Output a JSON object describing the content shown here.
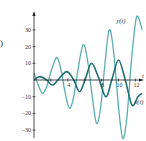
{
  "chart_data": {
    "type": "line",
    "title": "",
    "panel_label": ")",
    "xlabel": "t",
    "ylabel": "",
    "xlim": [
      0,
      13
    ],
    "ylim": [
      -35,
      40
    ],
    "x_ticks": [
      2,
      4,
      6,
      8,
      10,
      12
    ],
    "x_tick_labels": [
      "",
      "4",
      "",
      "8",
      "10",
      "12"
    ],
    "y_ticks": [
      30,
      20,
      10,
      -10,
      -20,
      -30
    ],
    "y_tick_labels": [
      "30",
      "20",
      "10",
      "−10",
      "−20",
      "−30"
    ],
    "grid": false,
    "legend": "inline labels at curve ends",
    "series": [
      {
        "name": "y(t)",
        "label": "y(t)",
        "color": "#5aaeae",
        "x": [
          0,
          0.5,
          1.0,
          1.5,
          2.0,
          2.5,
          2.8,
          3.2,
          3.7,
          4.2,
          4.7,
          5.2,
          5.8,
          6.3,
          6.9,
          7.4,
          7.9,
          8.4,
          8.9,
          9.4,
          10.0,
          10.5,
          11.0,
          11.5,
          12.0,
          12.3,
          12.8
        ],
        "values": [
          4,
          -3,
          -8,
          -4,
          5,
          12,
          13,
          6,
          -8,
          -17,
          -10,
          6,
          21,
          13,
          -10,
          -26,
          -16,
          10,
          30,
          18,
          -16,
          -35,
          -22,
          10,
          34,
          38,
          30
        ]
      },
      {
        "name": "x(t)",
        "label": "x(t)",
        "color": "#1f6f72",
        "x": [
          0,
          0.7,
          1.5,
          2.2,
          3.0,
          3.9,
          4.7,
          5.4,
          6.1,
          6.8,
          7.6,
          8.5,
          9.2,
          10.0,
          10.8,
          11.6,
          12.3,
          12.8
        ],
        "values": [
          0,
          2,
          0,
          -3,
          1,
          5,
          0,
          -7,
          1,
          10,
          2,
          -10,
          0,
          12,
          0,
          -15,
          -10,
          -8
        ]
      }
    ]
  }
}
